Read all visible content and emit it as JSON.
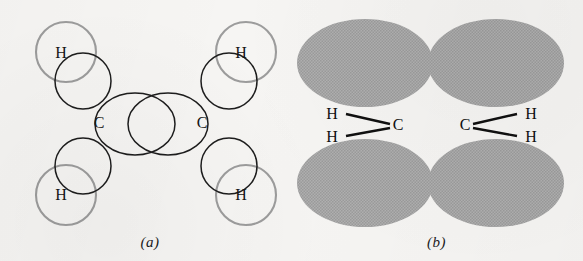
{
  "figure": {
    "background_color": "#f6f5f3"
  },
  "colors": {
    "sp2_orbital_stroke": "#1d1d1d",
    "hydrogen_orbital_stroke": "#9c9c9c",
    "p_orbital_fill": "#a9a9a9",
    "label_text": "#151515",
    "bond_line": "#101010"
  },
  "panel_a": {
    "caption": "(a)",
    "carbon_labels": [
      {
        "text": "C",
        "x": 99,
        "y": 128
      },
      {
        "text": "C",
        "x": 202,
        "y": 128
      }
    ],
    "hydrogen_labels": [
      {
        "text": "H",
        "x": 61,
        "y": 58
      },
      {
        "text": "H",
        "x": 241,
        "y": 58
      },
      {
        "text": "H",
        "x": 61,
        "y": 200
      },
      {
        "text": "H",
        "x": 241,
        "y": 200
      }
    ],
    "hydrogen_orbitals": [
      {
        "cx": 66,
        "cy": 52,
        "r": 30
      },
      {
        "cx": 246,
        "cy": 52,
        "r": 30
      },
      {
        "cx": 66,
        "cy": 195,
        "r": 30
      },
      {
        "cx": 246,
        "cy": 195,
        "r": 30
      }
    ],
    "sp2_orbitals": [
      {
        "cx": 83,
        "cy": 81,
        "r": 28
      },
      {
        "cx": 229,
        "cy": 81,
        "r": 28
      },
      {
        "cx": 83,
        "cy": 166,
        "r": 28
      },
      {
        "cx": 229,
        "cy": 166,
        "r": 28
      }
    ],
    "sigma_orbitals": [
      {
        "cx": 135,
        "cy": 124,
        "rx": 40,
        "ry": 31
      },
      {
        "cx": 168,
        "cy": 124,
        "rx": 40,
        "ry": 31
      }
    ]
  },
  "panel_b": {
    "caption": "(b)",
    "p_orbital_lobes": [
      {
        "cx": 75,
        "cy": 63,
        "rx": 68,
        "ry": 44,
        "position": "upper-left"
      },
      {
        "cx": 206,
        "cy": 63,
        "rx": 68,
        "ry": 44,
        "position": "upper-right"
      },
      {
        "cx": 75,
        "cy": 183,
        "rx": 68,
        "ry": 44,
        "position": "lower-left"
      },
      {
        "cx": 206,
        "cy": 183,
        "rx": 68,
        "ry": 44,
        "position": "lower-right"
      }
    ],
    "carbon_labels": [
      {
        "text": "C",
        "x": 108,
        "y": 130
      },
      {
        "text": "C",
        "x": 175,
        "y": 130
      }
    ],
    "hydrogen_labels": [
      {
        "text": "H",
        "x": 42,
        "y": 119
      },
      {
        "text": "H",
        "x": 42,
        "y": 140
      },
      {
        "text": "H",
        "x": 241,
        "y": 119
      },
      {
        "text": "H",
        "x": 241,
        "y": 140
      }
    ],
    "bonds": [
      {
        "x1": 56,
        "y1": 114,
        "x2": 100,
        "y2": 124
      },
      {
        "x1": 56,
        "y1": 136,
        "x2": 100,
        "y2": 128
      },
      {
        "x1": 183,
        "y1": 124,
        "x2": 227,
        "y2": 114
      },
      {
        "x1": 183,
        "y1": 128,
        "x2": 227,
        "y2": 136
      }
    ]
  }
}
